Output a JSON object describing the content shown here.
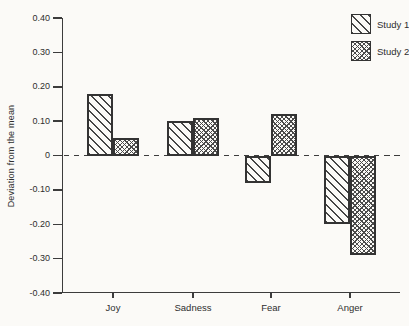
{
  "figure": {
    "background": "#fbfaf7",
    "axis_color": "#3c3c3c",
    "bar_border_color": "#333333",
    "hatch_color": "#4a4a4a"
  },
  "chart_data": {
    "type": "bar",
    "title": "",
    "xlabel": "",
    "ylabel": "Deviation from the mean",
    "ylim": [
      -0.4,
      0.4
    ],
    "ytick_values": [
      0.4,
      0.3,
      0.2,
      0.1,
      0,
      -0.1,
      -0.2,
      -0.3,
      -0.4
    ],
    "ytick_labels": [
      "0.40",
      "0.30",
      "0.20",
      "0.10",
      "0",
      "-0.10",
      "-0.20",
      "-0.30",
      "-0.40"
    ],
    "grid": false,
    "zero_line_style": "dashed",
    "legend_position": "top-right",
    "categories": [
      "Joy",
      "Sadness",
      "Fear",
      "Anger"
    ],
    "series": [
      {
        "name": "Study 1",
        "pattern": "diagonal-hatch",
        "values": [
          0.18,
          0.1,
          -0.08,
          -0.2
        ]
      },
      {
        "name": "Study 2",
        "pattern": "crosshatch",
        "values": [
          0.05,
          0.11,
          0.12,
          -0.29
        ]
      }
    ]
  }
}
